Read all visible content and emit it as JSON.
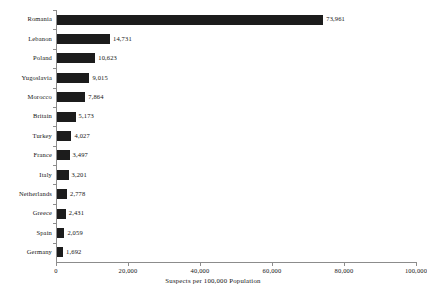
{
  "chart_data": {
    "type": "bar",
    "orientation": "horizontal",
    "title": "",
    "xlabel": "Suspects per 100,000 Population",
    "ylabel": "",
    "xlim": [
      0,
      100000
    ],
    "xticks": [
      0,
      20000,
      40000,
      60000,
      80000,
      100000
    ],
    "xtick_labels": [
      "0",
      "20,000",
      "40,000",
      "60,000",
      "80,000",
      "100,000"
    ],
    "grid": false,
    "legend": null,
    "bar_color": "#1c1c1c",
    "axis_color": "#8c8c8c",
    "background_color": "#ffffff",
    "categories": [
      "Romania",
      "Lebanon",
      "Poland",
      "Yugoslavia",
      "Morocco",
      "Britain",
      "Turkey",
      "France",
      "Italy",
      "Netherlands",
      "Greece",
      "Spain",
      "Germany"
    ],
    "values": [
      73961,
      14731,
      10623,
      9015,
      7864,
      5173,
      4027,
      3497,
      3201,
      2778,
      2431,
      2059,
      1692
    ],
    "value_labels": [
      "73,961",
      "14,731",
      "10,623",
      "9,015",
      "7,864",
      "5,173",
      "4,027",
      "3,497",
      "3,201",
      "2,778",
      "2,431",
      "2,059",
      "1,692"
    ]
  }
}
